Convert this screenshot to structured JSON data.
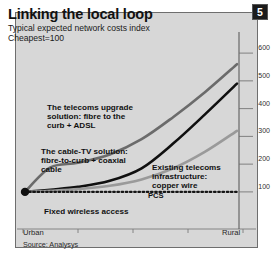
{
  "header": {
    "title": "Linking the local loop",
    "subtitle": "Typical expected network costs index",
    "subtitle2": "Cheapest=100",
    "badge": "5"
  },
  "footer": {
    "source": "Source: Analysys"
  },
  "chart_data": {
    "type": "line",
    "title": "Linking the local loop",
    "subtitle": "Typical expected network costs index",
    "note": "Cheapest=100",
    "xlabel": "",
    "ylabel": "",
    "x_axis_labels": [
      "Urban",
      "Rural"
    ],
    "xlim": [
      0,
      100
    ],
    "ylim": [
      60,
      640
    ],
    "grid": false,
    "legend": "inline-annotations",
    "y_ticks": [
      600,
      500,
      400,
      300,
      200,
      100
    ],
    "y_tick_side": "right",
    "x": [
      0,
      12,
      25,
      40,
      55,
      70,
      85,
      100
    ],
    "series": [
      {
        "name": "The telecoms upgrade solution: fibre to the curb + ADSL",
        "label": "The telecoms upgrade\nsolution: fibre to the\ncurb + ADSL",
        "color": "#6b6b6b",
        "style": "solid",
        "width": 2.6,
        "values": [
          100,
          188,
          205,
          235,
          290,
          370,
          460,
          560
        ]
      },
      {
        "name": "The cable-TV solution: fibre-to-curb + coaxial cable",
        "label": "The cable-TV solution:\nfibre-to-curb + coaxial\ncable",
        "color": "#101010",
        "style": "solid",
        "width": 2.6,
        "values": [
          100,
          108,
          118,
          140,
          185,
          275,
          380,
          490
        ]
      },
      {
        "name": "Existing telecoms infrastructure: copper wire",
        "label": "Existing telecoms\ninfrastructure:\ncopper wire",
        "color": "#9a9a9a",
        "style": "solid",
        "width": 2.6,
        "values": [
          100,
          104,
          110,
          122,
          145,
          185,
          245,
          320
        ]
      },
      {
        "name": "Fixed wireless access",
        "label": "Fixed wireless access",
        "color": "#151515",
        "style": "dotted",
        "width": 2.2,
        "values": [
          100,
          100,
          100,
          100,
          100,
          100,
          100,
          100
        ]
      }
    ],
    "annotations": [
      {
        "text": "PCS",
        "x": 62,
        "y": 150
      }
    ],
    "origin_marker": {
      "x": 0,
      "y": 100,
      "shape": "circle",
      "color": "#101010"
    }
  }
}
